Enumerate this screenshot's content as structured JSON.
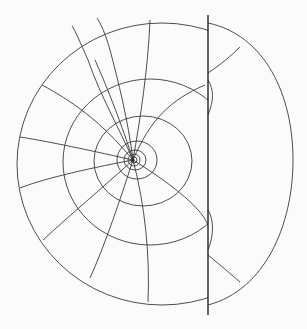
{
  "diagram": {
    "type": "conformal-grid",
    "colors": {
      "background": "#fbfbfb",
      "line": "#3a3a3a",
      "axis": "#222222"
    },
    "pole": {
      "x": 133,
      "y": 160
    },
    "boundary_line": {
      "x": 208,
      "y1": 15,
      "y2": 315
    },
    "rings": [
      {
        "cx": 134,
        "cy": 160,
        "rx": 3,
        "ry": 3
      },
      {
        "cx": 134,
        "cy": 160,
        "rx": 6,
        "ry": 6
      },
      {
        "cx": 135,
        "cy": 160,
        "rx": 11,
        "ry": 10
      },
      {
        "cx": 137,
        "cy": 160,
        "rx": 20,
        "ry": 19
      },
      {
        "cx": 143,
        "cy": 161,
        "rx": 49,
        "ry": 45
      },
      {
        "cx": 150,
        "cy": 162,
        "rx": 87,
        "ry": 83
      },
      {
        "cx": 162,
        "cy": 164,
        "rx": 145,
        "ry": 141
      }
    ],
    "outer_arc": "M208,23 C265,35 293,95 293,160 C293,225 265,290 208,305",
    "radials": [
      "M133,160 C120,130 100,95 88,60 C80,42 75,30 72,26",
      "M133,160 C128,120 118,80 110,50 C106,35 100,22 97,18",
      "M133,160 C140,120 148,70 150,20",
      "M133,160 C150,120 170,100 205,85",
      "M133,160 C80,148 40,140 20,137",
      "M133,160 C80,170 40,180 20,188",
      "M133,160 C100,190 70,215 43,240",
      "M133,160 C120,200 105,245 90,278",
      "M133,160 C145,205 150,255 148,302",
      "M133,160 C165,180 200,205 208,225",
      "M133,160 C100,120 70,100 42,85",
      "M133,160 C125,135 112,98 95,60"
    ],
    "right_cross_lines": [
      "M208,73 C220,65 232,55 240,47",
      "M208,80 C214,90 214,100 208,115",
      "M208,255 C220,265 232,275 240,282",
      "M208,250 C214,235 214,220 208,210"
    ],
    "background_text_legible": false
  }
}
